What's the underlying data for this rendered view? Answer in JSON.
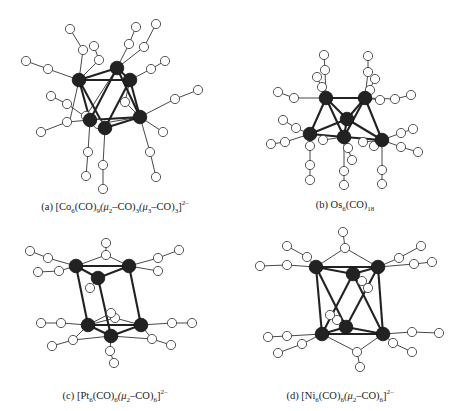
{
  "figure": {
    "panels": [
      {
        "id": "a",
        "label": "(a)",
        "formula_text": "[Co6(CO)9(μ2–CO)3(μ3–CO)3]2–",
        "parts": {
          "pre": "(a) [Co",
          "s1": "6",
          "p2": "(CO)",
          "s2": "9",
          "p3": "(μ",
          "s3": "2",
          "p4": "–CO)",
          "s4": "3",
          "p5": "(μ",
          "s5": "3",
          "p6": "–CO)",
          "s6": "3",
          "p7": "]",
          "sup": "2–"
        },
        "metal": "Co",
        "metal_count": 6,
        "geometry": "octahedron"
      },
      {
        "id": "b",
        "label": "(b)",
        "formula_text": "Os6(CO)18",
        "parts": {
          "pre": "(b) Os",
          "s1": "6",
          "p2": "(CO)",
          "s2": "18"
        },
        "metal": "Os",
        "metal_count": 6,
        "geometry": "bicapped tetrahedron"
      },
      {
        "id": "c",
        "label": "(c)",
        "formula_text": "[Pt6(CO)6(μ2–CO)6]2–",
        "parts": {
          "pre": "(c) [Pt",
          "s1": "6",
          "p2": "(CO)",
          "s2": "6",
          "p3": "(μ",
          "s3": "2",
          "p4": "–CO)",
          "s4": "6",
          "p5": "]",
          "sup": "2–"
        },
        "metal": "Pt",
        "metal_count": 6,
        "geometry": "trigonal prism"
      },
      {
        "id": "d",
        "label": "(d)",
        "formula_text": "[Ni6(CO)6(μ2–CO)6]2–",
        "parts": {
          "pre": "(d) [Ni",
          "s1": "6",
          "p2": "(CO)",
          "s2": "6",
          "p3": "(μ",
          "s3": "2",
          "p4": "–CO)",
          "s4": "6",
          "p5": "]",
          "sup": "2–"
        },
        "metal": "Ni",
        "metal_count": 6,
        "geometry": "octahedron"
      }
    ],
    "legend": {
      "metal_atom_color": "#222222",
      "ligand_atom_color": "#ffffff"
    }
  }
}
